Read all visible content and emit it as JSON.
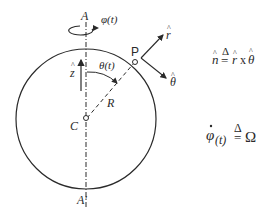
{
  "diagram": {
    "labels": {
      "axis_top": "A",
      "axis_bottom": "A'",
      "phi": "φ(t)",
      "z_hat": "z",
      "hat": "^",
      "theta": "θ(t)",
      "point_p": "P",
      "radius": "R",
      "center": "C",
      "r_hat": "r",
      "theta_hat": "θ"
    },
    "equations": {
      "n_def": {
        "lhs": "n",
        "delta": "Δ",
        "eq": "=",
        "r": "r",
        "times": "x",
        "theta": "θ"
      },
      "omega_def": {
        "lhs": "φ",
        "dot": "·",
        "arg": "(t)",
        "delta": "Δ",
        "eq": "=",
        "rhs": "Ω"
      }
    },
    "colors": {
      "stroke": "#2a2a2a",
      "background": "#ffffff"
    }
  }
}
